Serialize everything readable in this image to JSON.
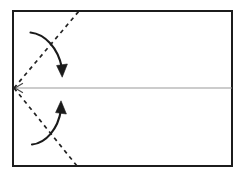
{
  "canvas": {
    "width": 245,
    "height": 176,
    "background": "#ffffff",
    "title": "Paper folding instruction diagram"
  },
  "colors": {
    "frame_stroke": "#1c1c1c",
    "fold_line_stroke": "#222222",
    "center_line_stroke": "#9a9a9a",
    "arrow_stroke": "#1a1a1a",
    "background": "#ffffff"
  },
  "figure": {
    "type": "origami-fold-diagram",
    "sheet": {
      "label": "paper-sheet",
      "x": 13,
      "y": 11,
      "width": 219,
      "height": 155,
      "stroke_width": 2
    },
    "center_line": {
      "label": "horizontal-center-crease",
      "x1": 15,
      "y1": 88,
      "x2": 232,
      "y2": 88,
      "stroke_width": 1,
      "arrowhead": "left",
      "arrowhead_style": "open-chevron"
    },
    "fold_lines": [
      {
        "label": "upper-diagonal-fold-line",
        "x1": 14,
        "y1": 88,
        "x2": 79,
        "y2": 11,
        "style": "dashed",
        "dash": "4 4",
        "stroke_width": 1.7
      },
      {
        "label": "lower-diagonal-fold-line",
        "x1": 14,
        "y1": 88,
        "x2": 77,
        "y2": 166,
        "style": "dashed",
        "dash": "4 4",
        "stroke_width": 1.7
      }
    ],
    "arrows": [
      {
        "label": "upper-fold-arrow",
        "direction": "down",
        "path": "M 30.5 32.5 C 45 34 58 48 62 68",
        "tip": {
          "x": 62,
          "y": 77
        },
        "stroke_width": 2.1,
        "head_width": 11,
        "head_length": 12
      },
      {
        "label": "lower-fold-arrow",
        "direction": "up",
        "path": "M 32 144.5 C 46 143 58 129 61 110",
        "tip": {
          "x": 61,
          "y": 101
        },
        "stroke_width": 2.1,
        "head_width": 11,
        "head_length": 12
      }
    ]
  }
}
